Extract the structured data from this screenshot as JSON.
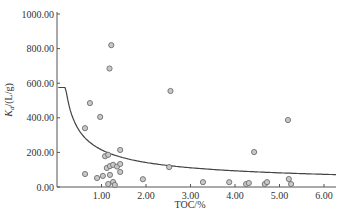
{
  "chart_data": {
    "type": "scatter",
    "title": "",
    "xlabel": "TOC/%",
    "ylabel": "Kd/(L/g)",
    "xlim": [
      0,
      6.3
    ],
    "ylim": [
      0,
      1000
    ],
    "x_ticks": [
      "1.00",
      "2.00",
      "3.00",
      "4.00",
      "5.00",
      "6.00"
    ],
    "y_ticks": [
      "0.00",
      "200.00",
      "400.00",
      "600.00",
      "800.00",
      "1000.00"
    ],
    "grid": false,
    "legend": null,
    "series": [
      {
        "name": "measured",
        "marker": "open-circle",
        "points": [
          {
            "x": 1.22,
            "y": 820
          },
          {
            "x": 1.18,
            "y": 685
          },
          {
            "x": 0.74,
            "y": 485
          },
          {
            "x": 0.97,
            "y": 405
          },
          {
            "x": 0.63,
            "y": 340
          },
          {
            "x": 2.55,
            "y": 555
          },
          {
            "x": 1.42,
            "y": 214
          },
          {
            "x": 1.08,
            "y": 178
          },
          {
            "x": 1.15,
            "y": 186
          },
          {
            "x": 1.12,
            "y": 110
          },
          {
            "x": 1.19,
            "y": 121
          },
          {
            "x": 1.26,
            "y": 128
          },
          {
            "x": 1.35,
            "y": 118
          },
          {
            "x": 1.42,
            "y": 133
          },
          {
            "x": 0.63,
            "y": 75
          },
          {
            "x": 0.9,
            "y": 52
          },
          {
            "x": 1.03,
            "y": 64
          },
          {
            "x": 1.19,
            "y": 70
          },
          {
            "x": 1.42,
            "y": 87
          },
          {
            "x": 1.15,
            "y": 17
          },
          {
            "x": 1.26,
            "y": 29
          },
          {
            "x": 1.3,
            "y": 12
          },
          {
            "x": 2.52,
            "y": 115
          },
          {
            "x": 1.93,
            "y": 45
          },
          {
            "x": 3.28,
            "y": 28
          },
          {
            "x": 3.87,
            "y": 28
          },
          {
            "x": 4.25,
            "y": 17
          },
          {
            "x": 4.31,
            "y": 23
          },
          {
            "x": 4.67,
            "y": 17
          },
          {
            "x": 4.72,
            "y": 28
          },
          {
            "x": 5.21,
            "y": 46
          },
          {
            "x": 5.26,
            "y": 17
          },
          {
            "x": 4.43,
            "y": 202
          },
          {
            "x": 5.19,
            "y": 387
          }
        ]
      },
      {
        "name": "fit curve",
        "type": "line",
        "equation": "Kd ≈ 215·TOC^-0.6",
        "points": [
          {
            "x": 0.05,
            "y": 575
          },
          {
            "x": 0.25,
            "y": 400
          },
          {
            "x": 0.5,
            "y": 320
          },
          {
            "x": 1.0,
            "y": 215
          },
          {
            "x": 2.0,
            "y": 150
          },
          {
            "x": 3.0,
            "y": 115
          },
          {
            "x": 4.0,
            "y": 95
          },
          {
            "x": 5.0,
            "y": 85
          },
          {
            "x": 6.25,
            "y": 75
          }
        ]
      }
    ]
  },
  "colors": {
    "axis": "#555555",
    "marker_stroke": "#6e6e6e",
    "marker_fill": "#c8c8c8",
    "curve": "#444444"
  }
}
